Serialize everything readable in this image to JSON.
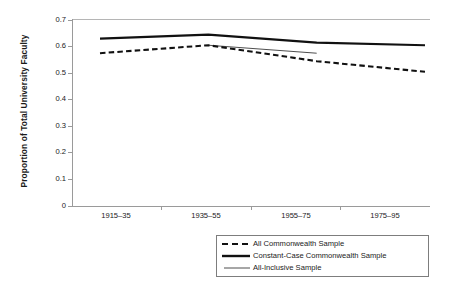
{
  "chart_data": {
    "type": "line",
    "title": "",
    "xlabel": "",
    "ylabel": "Proportion of Total University Faculty",
    "categories": [
      "1915–35",
      "1935–55",
      "1955–75",
      "1975–95"
    ],
    "ylim": [
      0,
      0.7
    ],
    "yticks": [
      "0",
      "0.1",
      "0.2",
      "0.3",
      "0.4",
      "0.5",
      "0.6",
      "0.7"
    ],
    "ytick_values": [
      0,
      0.1,
      0.2,
      0.3,
      0.4,
      0.5,
      0.6,
      0.7
    ],
    "grid": false,
    "legend_position": "bottom-right",
    "series": [
      {
        "name": "All Commonwealth Sample",
        "style": "dashed",
        "color": "#111111",
        "values": [
          0.575,
          0.605,
          0.545,
          0.505
        ]
      },
      {
        "name": "Constant-Case Commonwealth Sample",
        "style": "solid-thick",
        "color": "#111111",
        "values": [
          0.63,
          0.645,
          0.615,
          0.605
        ]
      },
      {
        "name": "All-Inclusive Sample",
        "style": "solid-thin",
        "color": "#333333",
        "values": [
          null,
          0.605,
          0.575,
          null
        ]
      }
    ]
  },
  "axis": {
    "y_title": "Proportion of Total University Faculty",
    "y_labels": [
      "0.7",
      "0.6",
      "0.5",
      "0.4",
      "0.3",
      "0.2",
      "0.1",
      "0"
    ],
    "x_labels": [
      "1915–35",
      "1935–55",
      "1955–75",
      "1975–95"
    ]
  },
  "legend": {
    "items": [
      {
        "label": "All Commonwealth Sample",
        "style": "dashed"
      },
      {
        "label": "Constant-Case Commonwealth Sample",
        "style": "solid-thick"
      },
      {
        "label": "All-Inclusive Sample",
        "style": "solid-thin"
      }
    ]
  }
}
